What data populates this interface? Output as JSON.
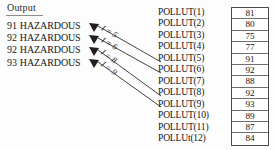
{
  "heading": {
    "text": "Output"
  },
  "output_lines": [
    {
      "number": "91",
      "status": "HAZARDOUS"
    },
    {
      "number": "92",
      "status": "HAZARDOUS"
    },
    {
      "number": "92",
      "status": "HAZARDOUS"
    },
    {
      "number": "93",
      "status": "HAZARDOUS"
    }
  ],
  "arrow_labels": [
    {
      "text": "I = 5"
    },
    {
      "text": "I = 6"
    },
    {
      "text": "I = 8"
    },
    {
      "text": "I = 9"
    }
  ],
  "array": {
    "labels": [
      "POLLUT(1)",
      "POLLUT(2)",
      "POLLUT(3)",
      "POLLUT(4)",
      "POLLUT(5)",
      "POLLUT(6)",
      "POLLUT(7)",
      "POLLUT(8)",
      "POLLUT(9)",
      "POLLUT(10)",
      "POLLUT(11)",
      "POLLUt(12)"
    ],
    "values": [
      "81",
      "80",
      "75",
      "77",
      "91",
      "92",
      "88",
      "92",
      "93",
      "89",
      "87",
      "84"
    ]
  },
  "colors": {
    "ink": "#161616",
    "rule": "#8d8d8d",
    "box_border": "#4a4a4a",
    "arrow": "#2e2e2e",
    "background": "#fdfdfd"
  }
}
